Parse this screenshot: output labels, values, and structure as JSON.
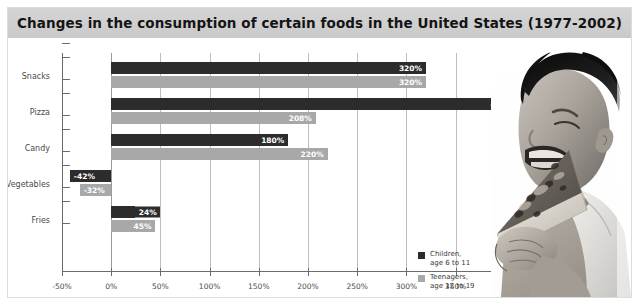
{
  "title": "Changes in the consumption of certain foods in the United States (1977-2002)",
  "legend": {
    "items": [
      {
        "label_line1": "Children,",
        "label_line2": "age 6 to 11",
        "color": "#2c2c2c",
        "swatch": "legend-swatch-children"
      },
      {
        "label_line1": "Teenagers,",
        "label_line2": "age 12 to 19",
        "color": "#a8a8a8",
        "swatch": "legend-swatch-teenagers"
      }
    ]
  },
  "photo": {
    "alt": "boy-eating-pizza-photo"
  },
  "chart_data": {
    "type": "bar",
    "orientation": "horizontal",
    "title": "Changes in the consumption of certain foods in the United States (1977-2002)",
    "xlabel": "",
    "ylabel": "",
    "xlim": [
      -50,
      450
    ],
    "xticks": [
      -50,
      0,
      50,
      100,
      150,
      200,
      250,
      300,
      350,
      400,
      450
    ],
    "xtick_labels": [
      "-50%",
      "0%",
      "50%",
      "100%",
      "150%",
      "200%",
      "250%",
      "300%",
      "350%",
      "400%",
      "450%"
    ],
    "grid": true,
    "grid_axis": "x",
    "legend_position": "inside-lower-right",
    "categories": [
      "Snacks",
      "Pizza",
      "Candy",
      "Vegetables",
      "Fries"
    ],
    "series": [
      {
        "name": "Children, age 6 to 11",
        "color": "#2c2c2c",
        "values": [
          320,
          413,
          180,
          -42,
          24
        ],
        "labels": [
          "320%",
          "413%",
          "180%",
          "-42%",
          "24%"
        ]
      },
      {
        "name": "Teenagers, age 12 to 19",
        "color": "#a8a8a8",
        "values": [
          320,
          208,
          220,
          -32,
          45
        ],
        "labels": [
          "320%",
          "208%",
          "220%",
          "-32%",
          "45%"
        ]
      }
    ]
  }
}
